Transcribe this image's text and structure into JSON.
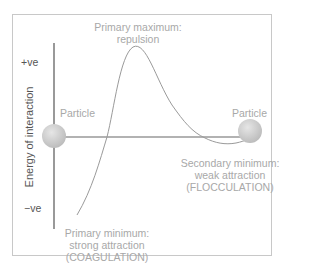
{
  "diagram": {
    "title": "",
    "y_axis": {
      "label": "Energy of interaction",
      "ticks": {
        "positive": "+ve",
        "negative": "−ve"
      }
    },
    "annotations": {
      "primary_maximum": {
        "line1": "Primary maximum:",
        "line2": "repulsion"
      },
      "primary_minimum": {
        "line1": "Primary minimum:",
        "line2": "strong attraction",
        "line3": "(COAGULATION)"
      },
      "secondary_minimum": {
        "line1": "Secondary minimum:",
        "line2": "weak attraction",
        "line3": "(FLOCCULATION)"
      }
    },
    "particles": [
      {
        "label": "Particle",
        "position": "left"
      },
      {
        "label": "Particle",
        "position": "right"
      }
    ],
    "colors": {
      "axis": "#555555",
      "curve": "#9a9a9a",
      "particle_fill": "#cfcfcf",
      "label_text": "#a8a8a8",
      "frame": "#c8c8c8"
    }
  }
}
